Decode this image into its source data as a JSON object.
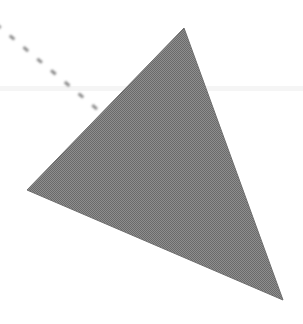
{
  "figure": {
    "canvas": {
      "width": 303,
      "height": 324,
      "background_color": "#ffffff"
    },
    "shapes": [
      {
        "name": "triangle",
        "type": "polygon",
        "label": "Shaded triangle",
        "vertices": [
          {
            "label": "apex",
            "x": 184,
            "y": 28
          },
          {
            "label": "left",
            "x": 27,
            "y": 190
          },
          {
            "label": "bottom-right",
            "x": 283,
            "y": 300
          }
        ],
        "points": "184,28 27,190 283,300",
        "fill_color": "#808080",
        "fill_style": "halftone-dither",
        "stroke_color": "#6e6e6e",
        "stroke_width": 1
      },
      {
        "name": "dashed-ray",
        "type": "line",
        "label": "Dashed ray",
        "start": {
          "x": -4,
          "y": 24
        },
        "end": {
          "x": 104,
          "y": 115
        },
        "stroke_color": "#8a8a8a",
        "stroke_width": 3,
        "dash_length": 6,
        "gap_length": 12,
        "dash_array": "6 12"
      }
    ],
    "artifacts": [
      {
        "name": "scan-band",
        "label": "Faint horizontal scan artifact",
        "y": 86,
        "height": 5,
        "color": "#f2f2f2",
        "opacity": 0.75
      }
    ]
  }
}
